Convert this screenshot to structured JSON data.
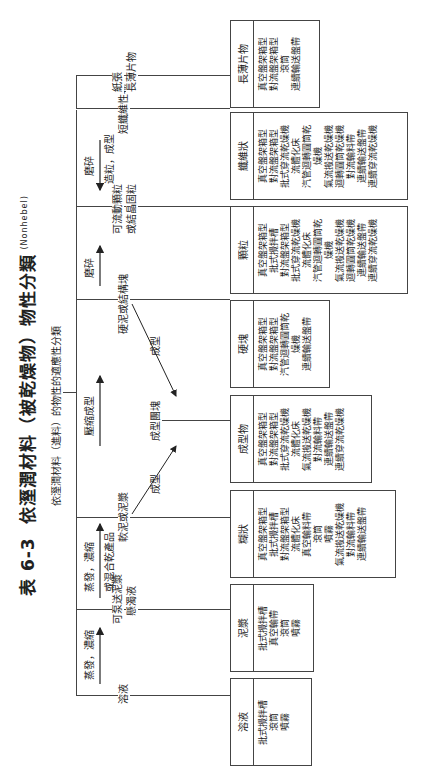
{
  "title": {
    "label": "表 6-3",
    "text": "依溼潤材料（被乾燥物）物性分類",
    "source": "(Nonhebel)"
  },
  "subtitle": "依溼潤材料（進料）的物性的適應性分類",
  "root_arrows": {
    "evap1": "蒸發，濃縮",
    "evap2": "蒸發，濃縮",
    "evap2_sub": "或混合乾產品",
    "press": "壓縮成型",
    "crush1": "磨碎",
    "crush2": "磨碎",
    "crush2_sub": "造粒，成型",
    "shape1": "成型",
    "shape2": "成型"
  },
  "branches": {
    "liquid": "溶液",
    "slurry_1": "可泵送泥漿",
    "slurry_2": "懸濁液",
    "paste": "軟泥或泥漿",
    "molded": "成型團塊",
    "hardcake": "硬泥或結構塊",
    "granule_1": "可流動顆粒",
    "granule_2": "或結晶固粒",
    "fiber": "短纖維性物",
    "sheet_1": "紙張",
    "sheet_2": "長薄片物"
  },
  "boxes": [
    {
      "name": "溶液",
      "items": [
        "批式攪拌槽",
        "滾筒",
        "噴霧"
      ]
    },
    {
      "name": "泥漿",
      "items": [
        "批式攪拌槽",
        "真空輸帶",
        "滾筒",
        "噴霧"
      ]
    },
    {
      "name": "糊狀",
      "items": [
        "真空盤架箱型",
        "批式攪拌槽",
        "對流盤架箱型",
        "流體化床",
        "真空輸料帶",
        "滾筒",
        "噴霧",
        "氣流搬送乾燥機",
        "對流輸料帶",
        "連續輸送盤帶"
      ]
    },
    {
      "name": "成型物",
      "items": [
        "真空盤架箱型",
        "對流盤架箱型",
        "批式穿流乾燥機",
        "流體化床",
        "氣流搬送乾燥機",
        "對流輸料帶",
        "連續輸送盤帶",
        "連續穿流乾燥機"
      ]
    },
    {
      "name": "硬塊",
      "items": [
        "真空盤架箱型",
        "對流盤架箱型",
        "汽管迴轉圓筒乾",
        "燥機",
        "連續輸送盤帶"
      ]
    },
    {
      "name": "顆粒",
      "items": [
        "真空盤架箱型",
        "批式攪拌槽",
        "對流盤架箱型",
        "批式穿流乾燥機",
        "流體化床",
        "汽管迴轉圓筒乾",
        "燥機",
        "氣流搬送乾燥機",
        "迴轉圓筒乾燥機",
        "連續輸送盤帶",
        "連續穿流乾燥機"
      ]
    },
    {
      "name": "纖維狀",
      "items": [
        "真空盤架箱型",
        "對流盤架箱型",
        "批式穿流乾燥機",
        "流體化床",
        "汽管迴轉圓筒乾",
        "燥機",
        "氣流搬送乾燥機",
        "迴轉圓筒乾燥機",
        "對流輸料帶",
        "連續輸送盤帶",
        "連續穿流乾燥機"
      ]
    },
    {
      "name": "長薄片物",
      "items": [
        "真空盤架箱型",
        "對流盤架箱型",
        "滾筒",
        "連續輸送盤帶"
      ]
    }
  ]
}
